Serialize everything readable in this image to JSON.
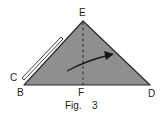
{
  "figure": {
    "caption_prefix": "Fig.",
    "caption_number": "3",
    "points": {
      "E": "E",
      "B": "B",
      "C": "C",
      "D": "D",
      "F": "F"
    },
    "colors": {
      "fill": "#8f8f8f",
      "stroke": "#2a2a2a",
      "fold_strip": "#ffffff",
      "text": "#222222"
    },
    "elements": {
      "triangle": "shaded triangle BED",
      "fold_line": "dashed line EF",
      "arrow": "curved arrow indicating fold direction",
      "flap": "folded flap edge at C"
    }
  }
}
